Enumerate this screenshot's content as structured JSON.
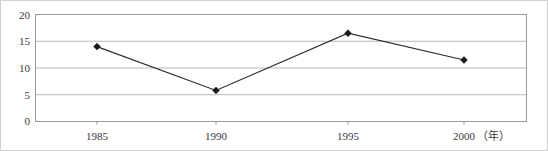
{
  "chart_data": {
    "type": "line",
    "title": "",
    "subtitle": "",
    "xlabel": "",
    "ylabel": "",
    "x_unit_annotation": "（年）",
    "categories": [
      "1985",
      "1990",
      "1995",
      "2000"
    ],
    "values": [
      14.0,
      5.8,
      16.5,
      11.5
    ],
    "series": [
      {
        "name": "",
        "values": [
          14.0,
          5.8,
          16.5,
          11.5
        ]
      }
    ],
    "ylim": [
      0,
      20
    ],
    "y_ticks": [
      "0",
      "5",
      "10",
      "15",
      "20"
    ],
    "y_tick_values": [
      0,
      5,
      10,
      15,
      20
    ],
    "x_ticks": [
      "1985",
      "1990",
      "1995",
      "2000"
    ],
    "grid": true,
    "grid_axis": "y",
    "legend": false,
    "legend_position": "none",
    "marker": "diamond",
    "annotations": []
  },
  "style": {
    "line_color": "#2b2b2b",
    "marker_color": "#1a1a1a",
    "grid_color": "#b8b8b8",
    "axis_color": "#9a9a9a",
    "frame_color": "#cfcfcf",
    "text_color": "#3a3a3a",
    "background": "#ffffff"
  }
}
